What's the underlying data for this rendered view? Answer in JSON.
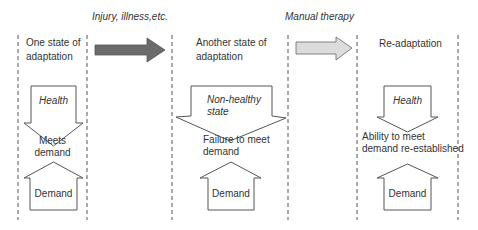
{
  "diagram": {
    "transitions": [
      {
        "label": "Injury, illness,etc.",
        "arrow_color": "#6b6b6b"
      },
      {
        "label": "Manual therapy",
        "arrow_color": "#d9d9d9"
      }
    ],
    "stages": [
      {
        "title_line1": "One state of",
        "title_line2": "adaptation",
        "state": "Health",
        "outcome_line1": "Meets",
        "outcome_line2": "demand",
        "demand": "Demand"
      },
      {
        "title_line1": "Another state of",
        "title_line2": "adaptation",
        "state_line1": "Non-healthy",
        "state_line2": "state",
        "outcome_line1": "Failure to meet",
        "outcome_line2": "demand",
        "demand": "Demand"
      },
      {
        "title_line1": "Re-adaptation",
        "state": "Health",
        "outcome_line1": "Ability to meet",
        "outcome_line2": "demand re-established",
        "demand": "Demand"
      }
    ]
  }
}
